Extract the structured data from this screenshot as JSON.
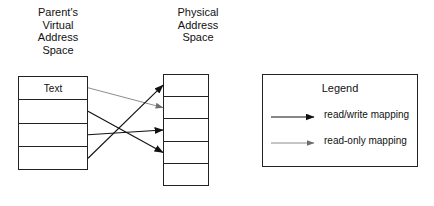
{
  "diagram": {
    "title_left": "Parent's\nVirtual\nAddress\nSpace",
    "title_right": "Physical\nAddress\nSpace",
    "virtual_table": {
      "rows": [
        "Text",
        "",
        "",
        ""
      ]
    },
    "physical_table": {
      "rows": [
        "",
        "",
        "",
        "",
        ""
      ]
    },
    "mappings": [
      {
        "from_row": 0,
        "to_row": 1,
        "type": "read-only"
      },
      {
        "from_row": 1,
        "to_row": 3,
        "type": "read/write"
      },
      {
        "from_row": 2,
        "to_row": 2,
        "type": "read/write"
      },
      {
        "from_row": 3,
        "to_row": 0,
        "type": "read/write"
      }
    ]
  },
  "legend": {
    "title": "Legend",
    "items": [
      {
        "label": "read/write mapping",
        "type": "read/write"
      },
      {
        "label": "read-only mapping",
        "type": "read-only"
      }
    ]
  },
  "colors": {
    "stroke": "#222222",
    "readwrite": "#111111",
    "readonly": "#6e6e6e",
    "background": "#ffffff"
  }
}
